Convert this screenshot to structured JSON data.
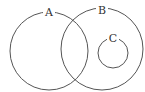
{
  "diagram": {
    "type": "venn",
    "sets": [
      {
        "id": "A",
        "label": "A",
        "cx": 49,
        "cy": 51,
        "r": 39,
        "label_x": 49,
        "label_y": 13
      },
      {
        "id": "B",
        "label": "B",
        "cx": 102,
        "cy": 49,
        "r": 41,
        "label_x": 102,
        "label_y": 11
      },
      {
        "id": "C",
        "label": "C",
        "cx": 113,
        "cy": 53,
        "r": 15,
        "label_x": 113,
        "label_y": 39
      }
    ],
    "relationships": [
      "A overlaps B",
      "C is a subset of B",
      "C is disjoint from A"
    ]
  },
  "colors": {
    "stroke": "#555555",
    "label": "#333333",
    "background": "#ffffff"
  }
}
